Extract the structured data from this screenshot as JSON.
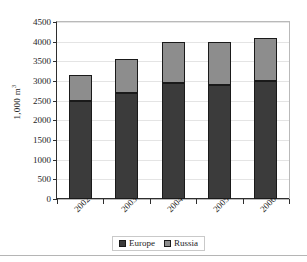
{
  "chart_data": {
    "type": "bar",
    "stacked": true,
    "title": "",
    "xlabel": "",
    "ylabel": "1,000 m³",
    "ylabel_parts": {
      "base": "1,000 m",
      "superscript": "3"
    },
    "categories": [
      "2002",
      "2003",
      "2004",
      "2005",
      "2006"
    ],
    "series": [
      {
        "name": "Europe",
        "color": "#3b3b3b",
        "values": [
          2480,
          2700,
          2950,
          2900,
          3000
        ]
      },
      {
        "name": "Russia",
        "color": "#8d8d8d",
        "values": [
          670,
          850,
          1050,
          1100,
          1100
        ]
      }
    ],
    "totals": [
      3150,
      3550,
      4000,
      4000,
      4100
    ],
    "ylim": [
      0,
      4500
    ],
    "ytick_step": 500,
    "yticks": [
      0,
      500,
      1000,
      1500,
      2000,
      2500,
      3000,
      3500,
      4000,
      4500
    ],
    "ytick_labels": [
      "0",
      "500",
      "1000",
      "1500",
      "2000",
      "2500",
      "3000",
      "3500",
      "4000",
      "4500"
    ],
    "grid": true,
    "legend_position": "bottom",
    "xlabel_rotation": -45
  },
  "legend": {
    "items": [
      {
        "label": "Europe",
        "color": "#3b3b3b"
      },
      {
        "label": "Russia",
        "color": "#8d8d8d"
      }
    ]
  }
}
